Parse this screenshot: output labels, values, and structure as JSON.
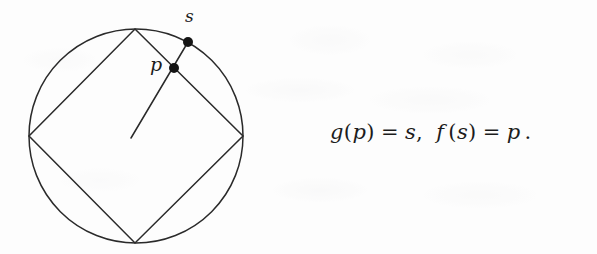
{
  "figure": {
    "kind": "geometric-diagram",
    "stroke_color": "#2a2a2a",
    "dot_color": "#141414",
    "background_color": "#fdfdfd",
    "circle": {
      "center_x": 136,
      "center_y": 136,
      "radius": 107
    },
    "inscribed_square": {
      "vertices": [
        {
          "name": "top",
          "x": 135,
          "y": 29
        },
        {
          "name": "right",
          "x": 243,
          "y": 136
        },
        {
          "name": "bottom",
          "x": 135,
          "y": 243
        },
        {
          "name": "left",
          "x": 29,
          "y": 136
        }
      ]
    },
    "radius_segment": {
      "from_x": 131,
      "from_y": 138,
      "to_x": 188,
      "to_y": 42
    },
    "points": [
      {
        "id": "p",
        "label": "p",
        "x": 174,
        "y": 68,
        "radius": 5,
        "on": "square-edge"
      },
      {
        "id": "s",
        "label": "s",
        "x": 188,
        "y": 42,
        "radius": 5,
        "on": "circle"
      }
    ]
  },
  "equation": {
    "full_text": "g(p) = s,   f(s) = p .",
    "left": {
      "func": "g",
      "open": "(",
      "arg": "p",
      "close": ")",
      "eq": "=",
      "result": "s",
      "comma": ","
    },
    "right": {
      "func": "f",
      "open": "(",
      "arg": "s",
      "close": ")",
      "eq": "=",
      "result": "p",
      "period": "."
    }
  }
}
